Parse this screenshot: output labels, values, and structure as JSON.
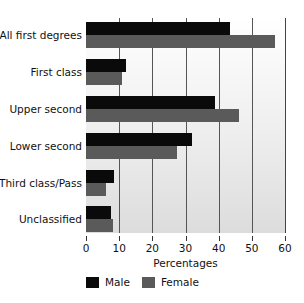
{
  "chart_data": {
    "type": "bar",
    "orientation": "horizontal",
    "title": "",
    "xlabel": "Percentages",
    "ylabel": "",
    "categories": [
      "All first degrees",
      "First class",
      "Upper second",
      "Lower second",
      "Third class/Pass",
      "Unclassified"
    ],
    "series": [
      {
        "name": "Male",
        "color": "#0a0a0a",
        "values": [
          43.5,
          12,
          39,
          32,
          8.5,
          7.5
        ]
      },
      {
        "name": "Female",
        "color": "#5a5a5a",
        "values": [
          57,
          11,
          46,
          27.5,
          6,
          8
        ]
      }
    ],
    "xlim": [
      0,
      60
    ],
    "xticks": [
      0,
      10,
      20,
      30,
      40,
      50,
      60
    ],
    "grid": true,
    "legend_position": "bottom"
  }
}
